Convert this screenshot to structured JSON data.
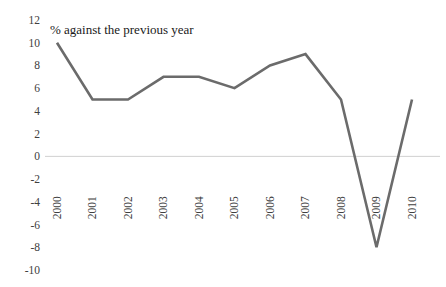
{
  "chart_data": {
    "type": "line",
    "title": "% against the previous year",
    "xlabel": "",
    "ylabel": "",
    "categories": [
      "2000",
      "2001",
      "2002",
      "2003",
      "2004",
      "2005",
      "2006",
      "2007",
      "2008",
      "2009",
      "2010"
    ],
    "values": [
      10,
      5,
      5,
      7,
      7,
      6,
      8,
      9,
      5,
      -8,
      5
    ],
    "series": [
      {
        "name": "% against the previous year",
        "values": [
          10,
          5,
          5,
          7,
          7,
          6,
          8,
          9,
          5,
          -8,
          5
        ]
      }
    ],
    "ylim": [
      -10,
      12
    ],
    "ytick_labels": [
      "12",
      "10",
      "8",
      "6",
      "4",
      "2",
      "0",
      "-2",
      "-4",
      "-6",
      "-8",
      "-10"
    ],
    "ytick_values": [
      12,
      10,
      8,
      6,
      4,
      2,
      0,
      -2,
      -4,
      -6,
      -8,
      -10
    ],
    "ytick_step": 2,
    "xtick_rotation": -90,
    "grid": false,
    "zero_line": true,
    "legend": false,
    "legend_position": "none",
    "line_color": "#6b6b6b",
    "zero_line_color": "#d0d0d0",
    "tick_label_color": "#404040",
    "title_color": "#1a1a1a",
    "background_color": "#ffffff"
  }
}
